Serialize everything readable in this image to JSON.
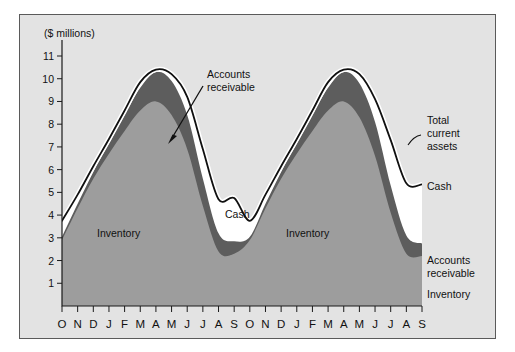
{
  "figure": {
    "background": "#ffffff",
    "panel_background": "#e3e3e3",
    "border_color": "#5a5a5a"
  },
  "chart_data": {
    "type": "area",
    "stacked": true,
    "title": "",
    "subtitle": "",
    "xlabel": "",
    "ylabel": "($ millions)",
    "ylim": [
      0,
      11
    ],
    "yticks": [
      1,
      2,
      3,
      4,
      5,
      6,
      7,
      8,
      9,
      10,
      11
    ],
    "grid": false,
    "legend_position": "right",
    "categories": [
      "O",
      "N",
      "D",
      "J",
      "F",
      "M",
      "A",
      "M",
      "J",
      "J",
      "A",
      "S",
      "O",
      "N",
      "D",
      "J",
      "F",
      "M",
      "A",
      "M",
      "J",
      "J",
      "A",
      "S"
    ],
    "series": [
      {
        "name": "Inventory",
        "color": "#9d9d9d",
        "values": [
          2.9,
          4.3,
          5.6,
          6.7,
          7.7,
          8.6,
          9.0,
          8.4,
          6.9,
          4.4,
          2.4,
          2.3,
          2.9,
          4.3,
          5.6,
          6.7,
          7.7,
          8.6,
          9.0,
          8.3,
          6.6,
          4.1,
          2.3,
          2.2
        ]
      },
      {
        "name": "Accounts receivable",
        "color": "#5d5d5d",
        "values": [
          0.15,
          0.2,
          0.3,
          0.45,
          0.7,
          1.0,
          1.3,
          1.5,
          1.5,
          1.2,
          0.8,
          0.55,
          0.15,
          0.2,
          0.3,
          0.45,
          0.7,
          1.0,
          1.3,
          1.5,
          1.5,
          1.2,
          0.8,
          0.55
        ]
      },
      {
        "name": "Cash",
        "color": "#ffffff",
        "values": [
          0.7,
          0.4,
          0.25,
          0.2,
          0.2,
          0.25,
          0.1,
          0.3,
          0.8,
          1.3,
          1.5,
          1.9,
          0.7,
          0.4,
          0.25,
          0.2,
          0.2,
          0.25,
          0.1,
          0.4,
          1.0,
          2.0,
          2.3,
          2.6
        ]
      }
    ],
    "total_line": {
      "name": "Total current assets",
      "color": "#101010",
      "values": [
        3.75,
        4.9,
        6.15,
        7.35,
        8.6,
        9.85,
        10.4,
        10.2,
        9.2,
        6.9,
        4.7,
        4.75,
        3.75,
        4.9,
        6.15,
        7.35,
        8.6,
        9.85,
        10.4,
        10.2,
        9.1,
        7.3,
        5.4,
        5.35
      ]
    },
    "annotations": [
      {
        "text_line1": "Accounts",
        "text_line2": "receivable",
        "kind": "arrow-callout"
      }
    ],
    "inside_labels": [
      {
        "label": "Inventory",
        "instance": 1
      },
      {
        "label": "Cash",
        "instance": 1
      },
      {
        "label": "Inventory",
        "instance": 2
      }
    ],
    "right_labels": [
      {
        "line1": "Total",
        "line2": "current",
        "line3": "assets"
      },
      {
        "line1": "Cash"
      },
      {
        "line1": "Accounts",
        "line2": "receivable"
      },
      {
        "line1": "Inventory"
      }
    ]
  },
  "axis": {
    "y_title": "($ millions)",
    "y_tick_labels": [
      "11",
      "10",
      "9",
      "8",
      "7",
      "6",
      "5",
      "4",
      "3",
      "2",
      "1"
    ],
    "x_tick_labels": [
      "O",
      "N",
      "D",
      "J",
      "F",
      "M",
      "A",
      "M",
      "J",
      "J",
      "A",
      "S",
      "O",
      "N",
      "D",
      "J",
      "F",
      "M",
      "A",
      "M",
      "J",
      "J",
      "A",
      "S"
    ]
  },
  "labels": {
    "inventory_1": "Inventory",
    "cash_center": "Cash",
    "inventory_2": "Inventory",
    "annotation_accounts_line1": "Accounts",
    "annotation_accounts_line2": "receivable",
    "legend_total_line1": "Total",
    "legend_total_line2": "current",
    "legend_total_line3": "assets",
    "legend_cash": "Cash",
    "legend_ar_line1": "Accounts",
    "legend_ar_line2": "receivable",
    "legend_inventory": "Inventory"
  }
}
